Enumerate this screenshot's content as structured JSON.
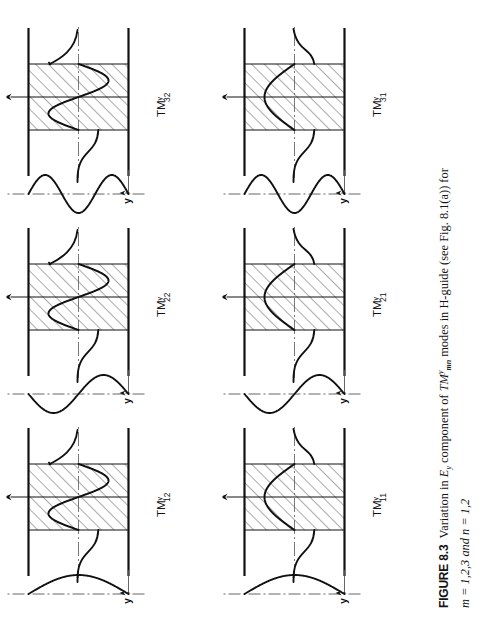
{
  "figure": {
    "number": "FIGURE 8.3",
    "caption_line1": "Variation in",
    "caption_Ey": "E",
    "caption_Ey_sub": "y",
    "caption_mid": "component of",
    "caption_TM": "TM",
    "caption_TM_sup": "y",
    "caption_TM_sub": "mn",
    "caption_tail": "modes in H-guide (see Fig. 8.1(a)) for",
    "caption_line2": "m = 1,2,3 and n = 1,2"
  },
  "axes": {
    "x_label": "x",
    "y_label": "y"
  },
  "panels": [
    {
      "id": "tm12",
      "base": "TM",
      "sup": "y",
      "sub": "12",
      "m": 1,
      "n": 2,
      "profile_halfcycles": 1,
      "main_halfcycles": 2,
      "column": 0,
      "row": 0
    },
    {
      "id": "tm22",
      "base": "TM",
      "sup": "y",
      "sub": "22",
      "m": 2,
      "n": 2,
      "profile_halfcycles": 2,
      "main_halfcycles": 2,
      "column": 1,
      "row": 0
    },
    {
      "id": "tm32",
      "base": "TM",
      "sup": "y",
      "sub": "32",
      "m": 3,
      "n": 2,
      "profile_halfcycles": 3,
      "main_halfcycles": 2,
      "column": 2,
      "row": 0
    },
    {
      "id": "tm11",
      "base": "TM",
      "sup": "y",
      "sub": "11",
      "m": 1,
      "n": 1,
      "profile_halfcycles": 1,
      "main_halfcycles": 1,
      "column": 0,
      "row": 1
    },
    {
      "id": "tm21",
      "base": "TM",
      "sup": "y",
      "sub": "21",
      "m": 2,
      "n": 1,
      "profile_halfcycles": 2,
      "main_halfcycles": 1,
      "column": 1,
      "row": 1
    },
    {
      "id": "tm31",
      "base": "TM",
      "sup": "y",
      "sub": "31",
      "m": 3,
      "n": 1,
      "profile_halfcycles": 3,
      "main_halfcycles": 1,
      "column": 2,
      "row": 1
    }
  ],
  "colors": {
    "ink": "#111111",
    "hatch": "#444444",
    "thin": "#555555",
    "background": "#ffffff"
  }
}
